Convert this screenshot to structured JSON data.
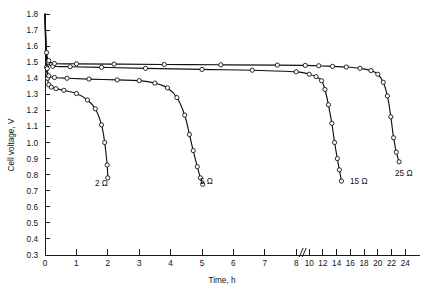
{
  "chart_data": {
    "type": "line",
    "title": "",
    "xlabel": "Time, h",
    "ylabel": "Cell voltage, V",
    "ylim": [
      0.3,
      1.8
    ],
    "ytick_labels": [
      "0.3",
      "0.4",
      "0.5",
      "0.6",
      "0.7",
      "0.8",
      "0.9",
      "1.0",
      "1.1",
      "1.2",
      "1.3",
      "1.4",
      "1.5",
      "1.6",
      "1.7",
      "1.8"
    ],
    "ytick_values": [
      0.3,
      0.4,
      0.5,
      0.6,
      0.7,
      0.8,
      0.9,
      1.0,
      1.1,
      1.2,
      1.3,
      1.4,
      1.5,
      1.6,
      1.7,
      1.8
    ],
    "xtick_labels": [
      "0",
      "1",
      "2",
      "3",
      "4",
      "5",
      "6",
      "7",
      "8",
      "10",
      "12",
      "14",
      "16",
      "18",
      "20",
      "22",
      "24"
    ],
    "xtick_values": [
      0,
      1,
      2,
      3,
      4,
      5,
      6,
      7,
      8,
      10,
      12,
      14,
      16,
      18,
      20,
      22,
      24
    ],
    "axis_break": {
      "present": true,
      "between": [
        8,
        10
      ],
      "glyph": "//"
    },
    "grid": false,
    "legend_position": "inline-end-of-curve",
    "series": [
      {
        "name": "2 Ω",
        "label": "2 Ω",
        "marker": "open-circle",
        "points": [
          [
            0.0,
            1.8
          ],
          [
            0.02,
            1.6
          ],
          [
            0.05,
            1.47
          ],
          [
            0.08,
            1.4
          ],
          [
            0.12,
            1.36
          ],
          [
            0.2,
            1.345
          ],
          [
            0.35,
            1.335
          ],
          [
            0.6,
            1.325
          ],
          [
            1.0,
            1.305
          ],
          [
            1.35,
            1.265
          ],
          [
            1.6,
            1.21
          ],
          [
            1.8,
            1.11
          ],
          [
            1.9,
            1.0
          ],
          [
            1.98,
            0.86
          ],
          [
            2.0,
            0.78
          ]
        ]
      },
      {
        "name": "5 Ω",
        "label": "5 Ω",
        "marker": "open-circle",
        "points": [
          [
            0.0,
            1.8
          ],
          [
            0.03,
            1.58
          ],
          [
            0.07,
            1.46
          ],
          [
            0.12,
            1.415
          ],
          [
            0.3,
            1.405
          ],
          [
            0.7,
            1.4
          ],
          [
            1.4,
            1.395
          ],
          [
            2.3,
            1.39
          ],
          [
            3.0,
            1.385
          ],
          [
            3.5,
            1.37
          ],
          [
            3.9,
            1.34
          ],
          [
            4.2,
            1.28
          ],
          [
            4.45,
            1.17
          ],
          [
            4.6,
            1.05
          ],
          [
            4.72,
            0.95
          ],
          [
            4.85,
            0.85
          ],
          [
            4.95,
            0.78
          ],
          [
            5.02,
            0.74
          ]
        ]
      },
      {
        "name": "15 Ω",
        "label": "15 Ω",
        "marker": "open-circle",
        "points": [
          [
            0.0,
            1.8
          ],
          [
            0.04,
            1.57
          ],
          [
            0.1,
            1.5
          ],
          [
            0.25,
            1.475
          ],
          [
            0.8,
            1.472
          ],
          [
            1.8,
            1.468
          ],
          [
            3.2,
            1.462
          ],
          [
            5.0,
            1.455
          ],
          [
            6.6,
            1.45
          ],
          [
            8.0,
            1.44
          ],
          [
            10.0,
            1.425
          ],
          [
            11.0,
            1.41
          ],
          [
            11.8,
            1.385
          ],
          [
            12.3,
            1.33
          ],
          [
            12.8,
            1.235
          ],
          [
            13.3,
            1.12
          ],
          [
            13.7,
            1.0
          ],
          [
            14.1,
            0.9
          ],
          [
            14.4,
            0.83
          ],
          [
            14.7,
            0.76
          ]
        ]
      },
      {
        "name": "25 Ω",
        "label": "25 Ω",
        "marker": "open-circle",
        "points": [
          [
            0.0,
            1.8
          ],
          [
            0.05,
            1.56
          ],
          [
            0.12,
            1.51
          ],
          [
            0.3,
            1.492
          ],
          [
            1.0,
            1.49
          ],
          [
            2.2,
            1.488
          ],
          [
            3.8,
            1.486
          ],
          [
            5.6,
            1.484
          ],
          [
            7.4,
            1.482
          ],
          [
            9.4,
            1.48
          ],
          [
            11.4,
            1.478
          ],
          [
            13.4,
            1.474
          ],
          [
            15.4,
            1.47
          ],
          [
            17.4,
            1.462
          ],
          [
            19.0,
            1.448
          ],
          [
            20.0,
            1.425
          ],
          [
            20.8,
            1.375
          ],
          [
            21.4,
            1.29
          ],
          [
            21.9,
            1.16
          ],
          [
            22.3,
            1.03
          ],
          [
            22.7,
            0.94
          ],
          [
            23.1,
            0.88
          ]
        ]
      }
    ],
    "series_label_positions": [
      {
        "name": "2 Ω",
        "x": 95,
        "y": 186
      },
      {
        "name": "5 Ω",
        "x": 200,
        "y": 184
      },
      {
        "name": "15 Ω",
        "x": 350,
        "y": 184
      },
      {
        "name": "25 Ω",
        "x": 395,
        "y": 176
      }
    ]
  }
}
